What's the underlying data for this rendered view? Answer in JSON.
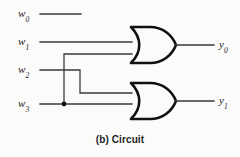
{
  "figure": {
    "caption": "(b) Circuit",
    "background_color": "#fbfbfa",
    "wire_color": "#3a3a3a",
    "gate_color": "#111111"
  },
  "inputs": [
    {
      "name": "w0",
      "base": "w",
      "subscript": "0"
    },
    {
      "name": "w1",
      "base": "w",
      "subscript": "1"
    },
    {
      "name": "w2",
      "base": "w",
      "subscript": "2"
    },
    {
      "name": "w3",
      "base": "w",
      "subscript": "3"
    }
  ],
  "outputs": [
    {
      "name": "y0",
      "base": "y",
      "subscript": "0"
    },
    {
      "name": "y1",
      "base": "y",
      "subscript": "1"
    }
  ],
  "gates": [
    {
      "id": "gate-or-top",
      "type": "OR",
      "inputs": [
        "w1",
        "w3"
      ],
      "output": "y0"
    },
    {
      "id": "gate-or-bottom",
      "type": "OR",
      "inputs": [
        "w2",
        "w3"
      ],
      "output": "y1"
    }
  ],
  "nets": [
    {
      "from": "w0",
      "to": null,
      "note": "unconnected stub"
    },
    {
      "from": "w1",
      "to": "gate-or-top.in1"
    },
    {
      "from": "w3",
      "to": "gate-or-top.in2",
      "junction": true
    },
    {
      "from": "w2",
      "to": "gate-or-bottom.in1"
    },
    {
      "from": "w3",
      "to": "gate-or-bottom.in2"
    }
  ],
  "equations": {
    "y0": "w1 + w3",
    "y1": "w2 + w3"
  }
}
